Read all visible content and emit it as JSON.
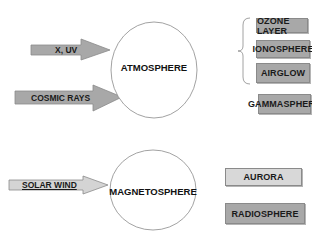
{
  "diagram": {
    "groups": [
      {
        "id": "atmosphere",
        "center_label": "ATMOSPHERE",
        "inputs": [
          "X, UV",
          "COSMIC RAYS"
        ],
        "bracketed_outputs": [
          "OZONE LAYER",
          "IONOSPHERE",
          "AIRGLOW"
        ],
        "outputs": [
          "GAMMASPHERE"
        ]
      },
      {
        "id": "magnetosphere",
        "center_label": "MAGNETOSPHERE",
        "inputs": [
          "SOLAR WIND"
        ],
        "outputs": [
          "AURORA",
          "RADIOSPHERE"
        ]
      }
    ]
  },
  "colors": {
    "dark_box": "#a8a8a8",
    "light_box": "#d8d8d8",
    "arrow_fill": "#a8a8a8",
    "arrow_light_fill": "#d4d4d4",
    "stroke": "#8a8a8a"
  }
}
